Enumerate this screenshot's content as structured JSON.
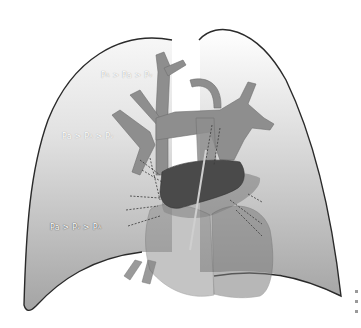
{
  "figure": {
    "zones": [
      {
        "id": "zone-1",
        "label": "PA > Pa > Pv",
        "parts": [
          {
            "main": "P",
            "sub": "A"
          },
          {
            "op": " > "
          },
          {
            "main": "Pa"
          },
          {
            "op": " > "
          },
          {
            "main": "P",
            "sub": "v"
          }
        ]
      },
      {
        "id": "zone-2",
        "label": "Pa > PA > Pv",
        "parts": [
          {
            "main": "Pa"
          },
          {
            "op": " > "
          },
          {
            "main": "P",
            "sub": "A"
          },
          {
            "op": " > "
          },
          {
            "main": "P",
            "sub": "v"
          }
        ]
      },
      {
        "id": "zone-3",
        "label": "Pa > Pv > PA",
        "parts": [
          {
            "main": "Pa"
          },
          {
            "op": " > "
          },
          {
            "main": "P",
            "sub": "v"
          },
          {
            "op": " > "
          },
          {
            "main": "P",
            "sub": "A"
          }
        ]
      }
    ],
    "colors": {
      "lung_top": "#f4f4f4",
      "lung_bottom": "#a8a8a8",
      "lung_outline": "#2a2a2a",
      "vessel": "#8e8e8e",
      "heart_dark": "#4a4a4a",
      "heart_mid": "#7a7a7a",
      "background": "#ffffff"
    }
  }
}
